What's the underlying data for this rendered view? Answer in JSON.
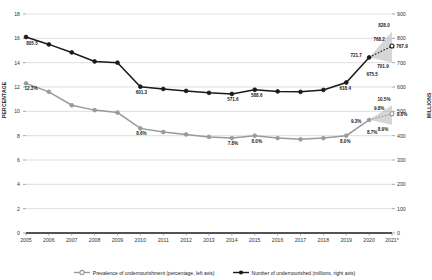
{
  "chart_data": {
    "type": "line",
    "title": "",
    "xlabel": "",
    "ylabel": "PERCENTAGE",
    "ylabel_right": "MILLIONS",
    "categories": [
      "2005",
      "2006",
      "2007",
      "2008",
      "2009",
      "2010",
      "2011",
      "2012",
      "2013",
      "2014",
      "2015",
      "2016",
      "2017",
      "2018",
      "2019",
      "2020",
      "2021*"
    ],
    "ylim": [
      0,
      18
    ],
    "ylim_right": [
      0,
      900
    ],
    "yticks": [
      0,
      2,
      4,
      6,
      8,
      10,
      12,
      14,
      16,
      18
    ],
    "yticks_right": [
      0,
      100,
      200,
      300,
      400,
      500,
      600,
      700,
      800,
      900
    ],
    "grid": true,
    "legend_position": "bottom",
    "series": [
      {
        "name": "Prevalence of undernourishment (percentage, left axis)",
        "axis": "left",
        "color": "#9a9a9a",
        "values": [
          12.3,
          11.6,
          10.5,
          10.1,
          9.9,
          8.6,
          8.3,
          8.1,
          7.9,
          7.8,
          8.0,
          7.8,
          7.7,
          7.8,
          8.0,
          9.3,
          9.8
        ],
        "labels": {
          "2005": "12.3%",
          "2010": "8.6%",
          "2014": "7.8%",
          "2015": "8.0%",
          "2019": "8.0%",
          "2020": "9.3%",
          "2021*": "9.8%"
        }
      },
      {
        "name": "Number of undernourished (millions, right axis)",
        "axis": "right",
        "color": "#1a1a1a",
        "values": [
          805.5,
          775.0,
          742.0,
          705.0,
          700.0,
          601.3,
          592.0,
          584.0,
          576.0,
          571.6,
          588.6,
          582.0,
          580.0,
          588.0,
          618.4,
          721.7,
          768.2
        ],
        "labels": {
          "2005": "805.5",
          "2010": "601.3",
          "2014": "571.6",
          "2015": "588.6",
          "2019": "618.4",
          "2020": "721.7",
          "2021*": "768.2"
        }
      }
    ],
    "projection_bands": [
      {
        "axis": "right",
        "from": "2020",
        "to": "2021*",
        "upper_label": "828.0",
        "mid_label": "768.2",
        "lower_label": "701.9",
        "marker_label": "767.9",
        "anchor_label": "675.5",
        "upper": 828.0,
        "lower": 701.9,
        "marker": 767.9
      },
      {
        "axis": "left",
        "from": "2020",
        "to": "2021*",
        "upper_label": "10.5%",
        "mid_label": "9.8%",
        "lower_label": "8.9%",
        "marker_label": "9.8%",
        "anchor_label": "8.7%",
        "upper": 10.5,
        "lower": 8.9,
        "marker": 9.8
      }
    ],
    "annotations": [
      {
        "id": "ann-828",
        "text": "828.0"
      },
      {
        "id": "ann-768",
        "text": "768.2"
      },
      {
        "id": "ann-7679",
        "text": "767.9"
      },
      {
        "id": "ann-7217",
        "text": "721.7"
      },
      {
        "id": "ann-7019",
        "text": "701.9"
      },
      {
        "id": "ann-6755",
        "text": "675.5"
      },
      {
        "id": "ann-6184",
        "text": "618.4"
      },
      {
        "id": "ann-5886",
        "text": "588.6"
      },
      {
        "id": "ann-5716",
        "text": "571.6"
      },
      {
        "id": "ann-6013",
        "text": "601.3"
      },
      {
        "id": "ann-8055",
        "text": "805.5"
      },
      {
        "id": "ann-105p",
        "text": "10.5%"
      },
      {
        "id": "ann-98p",
        "text": "9.8%"
      },
      {
        "id": "ann-98pb",
        "text": "9.8%"
      },
      {
        "id": "ann-93p",
        "text": "9.3%"
      },
      {
        "id": "ann-89p",
        "text": "8.9%"
      },
      {
        "id": "ann-87p",
        "text": "8.7%"
      },
      {
        "id": "ann-80p",
        "text": "8.0%"
      },
      {
        "id": "ann-80pb",
        "text": "8.0%"
      },
      {
        "id": "ann-78p",
        "text": "7.8%"
      },
      {
        "id": "ann-86p",
        "text": "8.6%"
      },
      {
        "id": "ann-123p",
        "text": "12.3%"
      }
    ]
  },
  "axes": {
    "left_title": "PERCENTAGE",
    "right_title": "MILLIONS",
    "left_ticks": [
      "18",
      "16",
      "14",
      "12",
      "10",
      "8",
      "6",
      "4",
      "2",
      "0"
    ],
    "right_ticks": [
      "900",
      "800",
      "700",
      "600",
      "500",
      "400",
      "300",
      "200",
      "100",
      "0"
    ],
    "x_ticks": [
      "2005",
      "2006",
      "2007",
      "2008",
      "2009",
      "2010",
      "2011",
      "2012",
      "2013",
      "2014",
      "2015",
      "2016",
      "2017",
      "2018",
      "2019",
      "2020",
      "2021*"
    ]
  },
  "legend": {
    "items": [
      {
        "label": "Prevalence of undernourishment (percentage, left axis)",
        "color": "#9a9a9a",
        "marker": "open-circle-marker"
      },
      {
        "label": "Number of undernourished (millions, right axis)",
        "color": "#1a1a1a",
        "marker": "filled-circle-marker"
      }
    ]
  }
}
